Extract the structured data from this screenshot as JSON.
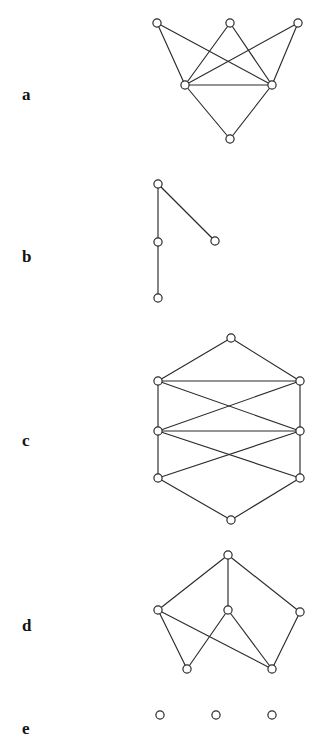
{
  "figure": {
    "title": "",
    "background_color": "#ffffff",
    "node_fill": "#ffffff",
    "node_stroke": "#2b2b2b",
    "edge_color": "#2b2b2b",
    "width": 326,
    "height": 740
  },
  "panels": [
    {
      "id": "a",
      "label": "a",
      "label_x": 22,
      "label_y": 86,
      "node_count": 6,
      "edge_count": 9,
      "nodes": [
        {
          "id": "a1",
          "x": 157,
          "y": 23
        },
        {
          "id": "a2",
          "x": 230,
          "y": 23
        },
        {
          "id": "a3",
          "x": 298,
          "y": 23
        },
        {
          "id": "a4",
          "x": 185,
          "y": 85
        },
        {
          "id": "a5",
          "x": 272,
          "y": 85
        },
        {
          "id": "a6",
          "x": 230,
          "y": 139
        }
      ],
      "edges": [
        [
          "a1",
          "a4"
        ],
        [
          "a1",
          "a5"
        ],
        [
          "a2",
          "a4"
        ],
        [
          "a2",
          "a5"
        ],
        [
          "a3",
          "a4"
        ],
        [
          "a3",
          "a5"
        ],
        [
          "a4",
          "a5"
        ],
        [
          "a4",
          "a6"
        ],
        [
          "a5",
          "a6"
        ]
      ]
    },
    {
      "id": "b",
      "label": "b",
      "label_x": 22,
      "label_y": 248,
      "node_count": 4,
      "edge_count": 3,
      "nodes": [
        {
          "id": "b1",
          "x": 158,
          "y": 184
        },
        {
          "id": "b2",
          "x": 158,
          "y": 242
        },
        {
          "id": "b3",
          "x": 158,
          "y": 298
        },
        {
          "id": "b4",
          "x": 215,
          "y": 241
        }
      ],
      "edges": [
        [
          "b1",
          "b2"
        ],
        [
          "b2",
          "b3"
        ],
        [
          "b1",
          "b4"
        ]
      ]
    },
    {
      "id": "c",
      "label": "c",
      "label_x": 22,
      "label_y": 432,
      "node_count": 8,
      "edge_count": 12,
      "nodes": [
        {
          "id": "c1",
          "x": 231,
          "y": 338
        },
        {
          "id": "c2",
          "x": 158,
          "y": 381
        },
        {
          "id": "c3",
          "x": 300,
          "y": 381
        },
        {
          "id": "c4",
          "x": 158,
          "y": 431
        },
        {
          "id": "c5",
          "x": 300,
          "y": 431
        },
        {
          "id": "c6",
          "x": 158,
          "y": 478
        },
        {
          "id": "c7",
          "x": 300,
          "y": 478
        },
        {
          "id": "c8",
          "x": 231,
          "y": 520
        }
      ],
      "edges": [
        [
          "c1",
          "c2"
        ],
        [
          "c1",
          "c3"
        ],
        [
          "c2",
          "c3"
        ],
        [
          "c2",
          "c4"
        ],
        [
          "c3",
          "c5"
        ],
        [
          "c2",
          "c5"
        ],
        [
          "c3",
          "c4"
        ],
        [
          "c4",
          "c5"
        ],
        [
          "c4",
          "c7"
        ],
        [
          "c5",
          "c6"
        ],
        [
          "c4",
          "c6"
        ],
        [
          "c5",
          "c7"
        ],
        [
          "c6",
          "c8"
        ],
        [
          "c7",
          "c8"
        ]
      ]
    },
    {
      "id": "d",
      "label": "d",
      "label_x": 22,
      "label_y": 617,
      "node_count": 6,
      "edge_count": 9,
      "nodes": [
        {
          "id": "d1",
          "x": 228,
          "y": 555
        },
        {
          "id": "d2",
          "x": 158,
          "y": 610
        },
        {
          "id": "d3",
          "x": 228,
          "y": 610
        },
        {
          "id": "d4",
          "x": 300,
          "y": 612
        },
        {
          "id": "d5",
          "x": 187,
          "y": 669
        },
        {
          "id": "d6",
          "x": 272,
          "y": 669
        }
      ],
      "edges": [
        [
          "d1",
          "d2"
        ],
        [
          "d1",
          "d3"
        ],
        [
          "d1",
          "d4"
        ],
        [
          "d2",
          "d5"
        ],
        [
          "d2",
          "d6"
        ],
        [
          "d3",
          "d5"
        ],
        [
          "d3",
          "d6"
        ],
        [
          "d4",
          "d6"
        ]
      ]
    },
    {
      "id": "e",
      "label": "e",
      "label_x": 22,
      "label_y": 720,
      "node_count": 3,
      "edge_count": 0,
      "nodes": [
        {
          "id": "e1",
          "x": 160,
          "y": 715
        },
        {
          "id": "e2",
          "x": 216,
          "y": 715
        },
        {
          "id": "e3",
          "x": 272,
          "y": 715
        }
      ],
      "edges": []
    }
  ]
}
